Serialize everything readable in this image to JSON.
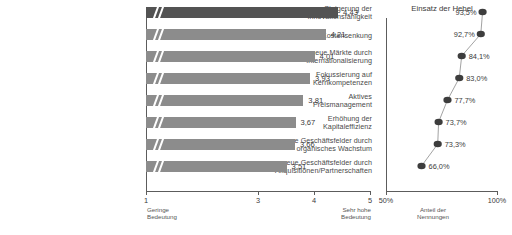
{
  "chart_data": [
    {
      "type": "bar",
      "orientation": "horizontal",
      "title": "",
      "xlabel": "",
      "ylabel": "",
      "xlim": [
        1,
        5
      ],
      "xticks": [
        1,
        3,
        4,
        5
      ],
      "xtick_labels": [
        "1",
        "3",
        "4",
        "5"
      ],
      "axis_break": true,
      "axis_low_caption": "Geringe\nBedeutung",
      "axis_low_caption_line1": "Geringe",
      "axis_low_caption_line2": "Bedeutung",
      "axis_high_caption_line1": "Sehr hohe",
      "axis_high_caption_line2": "Bedeutung",
      "grid": false,
      "categories": [
        "Steigerung der Innovationsfähigkeit",
        "Kostensenkung",
        "neue Märkte durch Internationalisierung",
        "Fokussierung auf Kernkompetenzen",
        "Aktives Preismanagement",
        "Erhöhung der Kapitaleffizienz",
        "neue Geschäftsfelder durch organisches Wachstum",
        "neue Geschäftsfelder durch Akquisitionen/Partnerschaften"
      ],
      "category_lines": [
        [
          "Steigerung der",
          "Innovationsfähigkeit"
        ],
        [
          "Kostensenkung"
        ],
        [
          "neue Märkte durch",
          "Internationalisierung"
        ],
        [
          "Fokussierung auf",
          "Kernkompetenzen"
        ],
        [
          "Aktives",
          "Preismanagement"
        ],
        [
          "Erhöhung der",
          "Kapitaleffizienz"
        ],
        [
          "neue Geschäftsfelder durch",
          "organisches Wachstum"
        ],
        [
          "neue Geschäftsfelder durch",
          "Akquisitionen/Partnerschaften"
        ]
      ],
      "values": [
        4.43,
        4.21,
        4.01,
        3.93,
        3.81,
        3.67,
        3.66,
        3.51
      ],
      "value_labels": [
        "4,43",
        "4,21",
        "4,01",
        "3,93",
        "3,81",
        "3,67",
        "3,66",
        "3,51"
      ],
      "bar_colors": [
        "#535353",
        "#8c8c8c",
        "#8c8c8c",
        "#8c8c8c",
        "#8c8c8c",
        "#8c8c8c",
        "#8c8c8c",
        "#8c8c8c"
      ]
    },
    {
      "type": "scatter",
      "title": "Einsatz der Hebel",
      "xlabel_line1": "Anteil der",
      "xlabel_line2": "Nennungen",
      "ylabel": "",
      "xlim": [
        50,
        100
      ],
      "xticks": [
        50,
        100
      ],
      "xtick_labels": [
        "50%",
        "100%"
      ],
      "grid": false,
      "connected": true,
      "marker_color": "#3d3d3d",
      "values": [
        93.5,
        92.7,
        84.1,
        83.0,
        77.7,
        73.7,
        73.3,
        66.0
      ],
      "value_labels": [
        "93,5%",
        "92,7%",
        "84,1%",
        "83,0%",
        "77,7%",
        "73,7%",
        "73,3%",
        "66,0%"
      ],
      "label_side": [
        "left",
        "left",
        "right",
        "right",
        "right",
        "right",
        "right",
        "right"
      ]
    }
  ],
  "colors": {
    "bar_primary": "#535353",
    "bar_secondary": "#8c8c8c",
    "axis": "#5c5c5c",
    "text": "#3a3a3a",
    "background": "#ffffff"
  }
}
